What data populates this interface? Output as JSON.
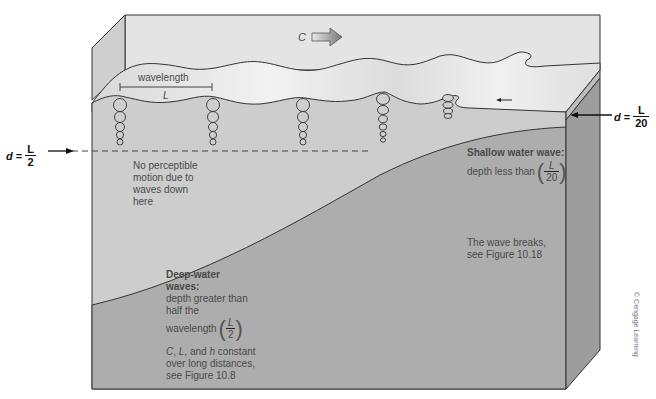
{
  "diagram": {
    "type": "cross-section",
    "colors": {
      "water_surface": "#e2e2e2",
      "water_body": "#c9c9c9",
      "seafloor": "#a8a8a8",
      "side_face": "#9a9a9a",
      "outline": "#333333",
      "arrow_fill": "#8c8c8c"
    }
  },
  "labels": {
    "celerity": "C",
    "wavelength": "wavelength",
    "wavelength_symbol": "L",
    "no_motion": [
      "No perceptible",
      "motion due to",
      "waves down",
      "here"
    ],
    "deep_water": {
      "title_line1": "Deep-water",
      "title_line2": "waves:",
      "line1": "depth greater than",
      "line2": "half the",
      "line3": "wavelength",
      "frac_num": "L",
      "frac_den": "2",
      "note_line1_c": "C",
      "note_line1_sep1": ", ",
      "note_line1_l": "L",
      "note_line1_mid": ", and ",
      "note_line1_h": "h",
      "note_line1_end": " constant",
      "note_line2": "over long distances,",
      "note_line3": "see Figure 10.8"
    },
    "shallow_water": {
      "title": "Shallow water wave:",
      "line1": "depth less than",
      "frac_num": "L",
      "frac_den": "20"
    },
    "breaks": {
      "line1": "The wave breaks,",
      "line2": "see Figure 10.18"
    },
    "depth_left": {
      "var": "d",
      "eq": "=",
      "num": "L",
      "den": "2"
    },
    "depth_right": {
      "var": "d",
      "eq": "=",
      "num": "L",
      "den": "20"
    },
    "credit": "© Cengage Learning"
  }
}
